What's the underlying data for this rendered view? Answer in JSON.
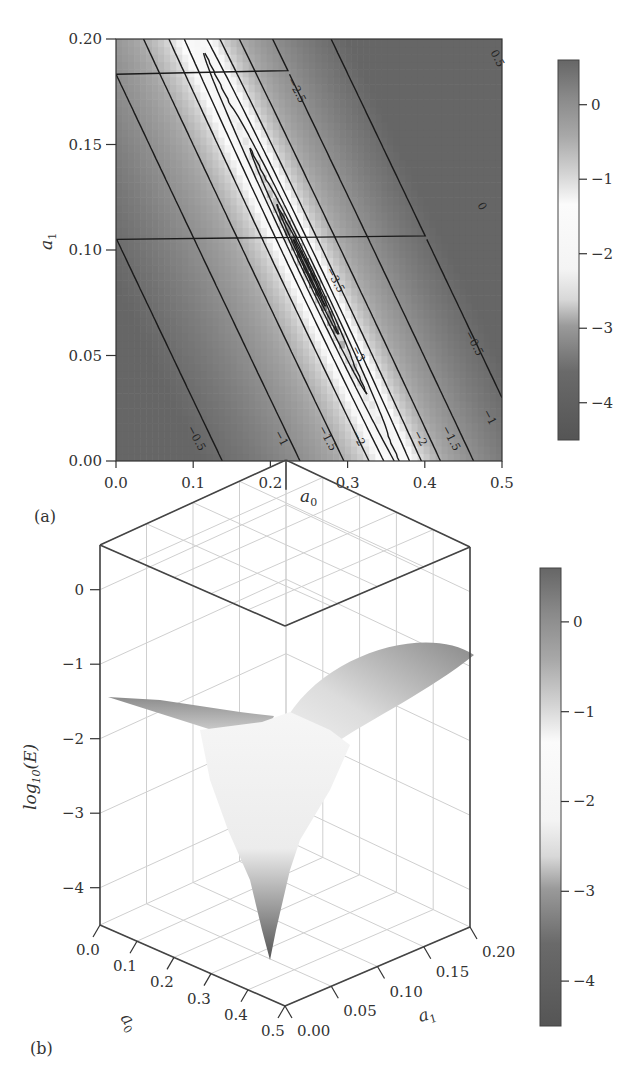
{
  "chart_data": [
    {
      "panel": "(a)",
      "type": "heatmap",
      "subtype": "filled contour with contour lines",
      "title": "",
      "xlabel": "a0",
      "ylabel": "a1",
      "xlim": [
        0.0,
        0.5
      ],
      "ylim": [
        0.0,
        0.2
      ],
      "xticks": [
        "0.0",
        "0.1",
        "0.2",
        "0.3",
        "0.4",
        "0.5"
      ],
      "yticks": [
        "0.00",
        "0.05",
        "0.10",
        "0.15",
        "0.20"
      ],
      "x_tick_values": [
        0.0,
        0.1,
        0.2,
        0.3,
        0.4,
        0.5
      ],
      "y_tick_values": [
        0.0,
        0.05,
        0.1,
        0.15,
        0.2
      ],
      "z_quantity": "log10(E)",
      "minimum": {
        "a0": 0.25,
        "a1": 0.09,
        "log10E": -4.3
      },
      "valley_direction": "from (0.20, 0.14) down-right to (0.32, 0.03)",
      "contour_levels": [
        0.5,
        0,
        -0.5,
        -1,
        -1.5,
        -2,
        -2.5,
        -3,
        -3.5
      ],
      "contour_labels": [
        {
          "text": "-0.5",
          "near": [
            0.1,
            0.01
          ]
        },
        {
          "text": "-1",
          "near": [
            0.21,
            0.01
          ]
        },
        {
          "text": "-1.5",
          "near": [
            0.27,
            0.01
          ]
        },
        {
          "text": "-2",
          "near": [
            0.31,
            0.01
          ]
        },
        {
          "text": "-2",
          "near": [
            0.39,
            0.01
          ]
        },
        {
          "text": "-1.5",
          "near": [
            0.43,
            0.01
          ]
        },
        {
          "text": "-1",
          "near": [
            0.48,
            0.02
          ]
        },
        {
          "text": "-0.5",
          "near": [
            0.46,
            0.055
          ]
        },
        {
          "text": "0",
          "near": [
            0.47,
            0.12
          ]
        },
        {
          "text": "0.5",
          "near": [
            0.49,
            0.19
          ]
        },
        {
          "text": "-2.5",
          "near": [
            0.23,
            0.175
          ]
        },
        {
          "text": "-3",
          "near": [
            0.31,
            0.05
          ]
        },
        {
          "text": "-3.5",
          "near": [
            0.28,
            0.085
          ]
        }
      ],
      "colorbar": {
        "ticks": [
          "0",
          "−1",
          "−2",
          "−3",
          "−4"
        ],
        "tick_values": [
          0,
          -1,
          -2,
          -3,
          -4
        ],
        "range": [
          -4.5,
          0.6
        ]
      },
      "colormap": "gray: dark at extremes, white near -1.5 to -2.5"
    },
    {
      "panel": "(b)",
      "type": "surface3d",
      "title": "",
      "xlabel": "a0",
      "ylabel": "a1",
      "zlabel": "log10(E)",
      "xlim": [
        0.0,
        0.5
      ],
      "ylim": [
        0.0,
        0.2
      ],
      "zlim": [
        -4.5,
        0.6
      ],
      "xticks": [
        "0.0",
        "0.1",
        "0.2",
        "0.3",
        "0.4",
        "0.5"
      ],
      "x_tick_values": [
        0.0,
        0.1,
        0.2,
        0.3,
        0.4,
        0.5
      ],
      "yticks": [
        "0.00",
        "0.05",
        "0.10",
        "0.15",
        "0.20"
      ],
      "y_tick_values": [
        0.0,
        0.05,
        0.1,
        0.15,
        0.2
      ],
      "zticks": [
        "0",
        "−1",
        "−2",
        "−3",
        "−4"
      ],
      "z_tick_values": [
        0,
        -1,
        -2,
        -3,
        -4
      ],
      "surface_corners": [
        {
          "a0": 0.0,
          "a1": 0.0,
          "log10E": -0.2
        },
        {
          "a0": 0.0,
          "a1": 0.2,
          "log10E": 0.0
        },
        {
          "a0": 0.5,
          "a1": 0.2,
          "log10E": 0.5
        },
        {
          "a0": 0.5,
          "a1": 0.0,
          "log10E": -1.0
        }
      ],
      "minimum": {
        "a0": 0.25,
        "a1": 0.09,
        "log10E": -4.3
      },
      "grid": true,
      "colorbar": {
        "ticks": [
          "0",
          "−1",
          "−2",
          "−3",
          "−4"
        ],
        "tick_values": [
          0,
          -1,
          -2,
          -3,
          -4
        ],
        "range": [
          -4.5,
          0.6
        ]
      }
    }
  ],
  "labels": {
    "panel_a": "(a)",
    "panel_b": "(b)",
    "a_xlabel_main": "a",
    "a_xlabel_sub": "0",
    "a_ylabel_main": "a",
    "a_ylabel_sub": "1",
    "b_zlabel_prefix": "log",
    "b_zlabel_sub": "10",
    "b_zlabel_suffix": "(E)",
    "b_a0_main": "a",
    "b_a0_sub": "0",
    "b_a1_main": "a",
    "b_a1_sub": "1"
  }
}
